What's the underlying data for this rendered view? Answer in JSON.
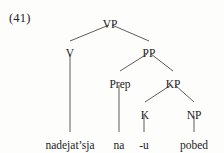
{
  "example": {
    "number_label": "(41)"
  },
  "tree": {
    "type": "constituency-syntax-tree",
    "nodes": [
      {
        "id": "VP",
        "label": "VP",
        "x": 110,
        "y": 18,
        "kind": "nonterminal"
      },
      {
        "id": "V",
        "label": "V",
        "x": 70,
        "y": 47,
        "kind": "nonterminal"
      },
      {
        "id": "PP",
        "label": "PP",
        "x": 149,
        "y": 47,
        "kind": "nonterminal"
      },
      {
        "id": "Prep",
        "label": "Prep",
        "x": 120,
        "y": 78,
        "kind": "nonterminal"
      },
      {
        "id": "KP",
        "label": "KP",
        "x": 173,
        "y": 78,
        "kind": "nonterminal"
      },
      {
        "id": "K",
        "label": "K",
        "x": 145,
        "y": 109,
        "kind": "nonterminal"
      },
      {
        "id": "NP",
        "label": "NP",
        "x": 194,
        "y": 109,
        "kind": "nonterminal"
      }
    ],
    "terminals": [
      {
        "id": "t-nadejatsja",
        "label": "nadejat’sja",
        "x": 70,
        "y": 139,
        "parent": "V"
      },
      {
        "id": "t-na",
        "label": "na",
        "x": 119,
        "y": 139,
        "parent": "Prep"
      },
      {
        "id": "t-u",
        "label": "-u",
        "x": 144,
        "y": 139,
        "parent": "K"
      },
      {
        "id": "t-pobed",
        "label": "pobed",
        "x": 194,
        "y": 139,
        "parent": "NP"
      }
    ],
    "edges": [
      {
        "from": "VP",
        "to": "V",
        "x1": 109,
        "y1": 25,
        "x2": 70,
        "y2": 41
      },
      {
        "from": "VP",
        "to": "PP",
        "x1": 112,
        "y1": 25,
        "x2": 149,
        "y2": 41
      },
      {
        "from": "PP",
        "to": "Prep",
        "x1": 147,
        "y1": 54,
        "x2": 120,
        "y2": 71
      },
      {
        "from": "PP",
        "to": "KP",
        "x1": 151,
        "y1": 54,
        "x2": 173,
        "y2": 71
      },
      {
        "from": "KP",
        "to": "K",
        "x1": 171,
        "y1": 85,
        "x2": 145,
        "y2": 102
      },
      {
        "from": "KP",
        "to": "NP",
        "x1": 175,
        "y1": 85,
        "x2": 194,
        "y2": 102
      },
      {
        "from": "V",
        "to": "t-nadejatsja",
        "x1": 70,
        "y1": 54,
        "x2": 70,
        "y2": 132
      },
      {
        "from": "Prep",
        "to": "t-na",
        "x1": 119,
        "y1": 85,
        "x2": 119,
        "y2": 132
      },
      {
        "from": "K",
        "to": "t-u",
        "x1": 144,
        "y1": 116,
        "x2": 144,
        "y2": 132
      },
      {
        "from": "NP",
        "to": "t-pobed",
        "x1": 194,
        "y1": 116,
        "x2": 194,
        "y2": 132
      }
    ]
  },
  "colors": {
    "background": "#fdfdfc",
    "text": "#232323",
    "line": "#4a4a4a"
  }
}
